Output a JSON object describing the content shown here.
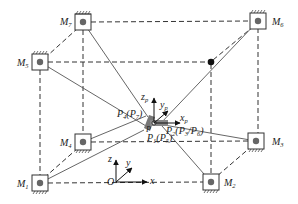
{
  "diagram": {
    "type": "cable-driven parallel robot schematic",
    "motors": [
      {
        "id": "M1",
        "label": "M",
        "sub": "1",
        "x": 40,
        "y": 183,
        "mount": "bottom"
      },
      {
        "id": "M2",
        "label": "M",
        "sub": "2",
        "x": 211,
        "y": 182,
        "mount": "bottom"
      },
      {
        "id": "M3",
        "label": "M",
        "sub": "3",
        "x": 256,
        "y": 141,
        "mount": "bottom"
      },
      {
        "id": "M4",
        "label": "M",
        "sub": "4",
        "x": 83,
        "y": 142,
        "mount": "bottom"
      },
      {
        "id": "M5",
        "label": "M",
        "sub": "5",
        "x": 40,
        "y": 62,
        "mount": "top"
      },
      {
        "id": "M6",
        "label": "M",
        "sub": "6",
        "x": 258,
        "y": 21,
        "mount": "top"
      },
      {
        "id": "M7",
        "label": "M",
        "sub": "7",
        "x": 83,
        "y": 22,
        "mount": "top"
      }
    ],
    "hidden_corner": {
      "x": 211,
      "y": 62
    },
    "platform": {
      "center": {
        "x": 152,
        "y": 125
      },
      "labels": {
        "p4": "P4(P7)",
        "p1": "P1(P5)",
        "p2": "P2(P3/P6)",
        "p": "P"
      },
      "frame_axes": {
        "z": "z",
        "z_sub": "p",
        "y": "y",
        "y_sub": "p",
        "x": "x",
        "x_sub": "p"
      }
    },
    "world_frame": {
      "origin_label": "O",
      "axes": {
        "x": "x",
        "y": "y",
        "z": "z"
      }
    }
  },
  "labels": {
    "M1": {
      "main": "M",
      "sub": "1"
    },
    "M2": {
      "main": "M",
      "sub": "2"
    },
    "M3": {
      "main": "M",
      "sub": "3"
    },
    "M4": {
      "main": "M",
      "sub": "4"
    },
    "M5": {
      "main": "M",
      "sub": "5"
    },
    "M6": {
      "main": "M",
      "sub": "6"
    },
    "M7": {
      "main": "M",
      "sub": "7"
    },
    "P4": {
      "main": "P",
      "sub": "4",
      "paren_main": "P",
      "paren_sub": "7"
    },
    "P1": {
      "main": "P",
      "sub": "1",
      "paren_main": "P",
      "paren_sub": "5"
    },
    "P2": {
      "main": "P",
      "sub": "2",
      "paren_a": "P",
      "paren_a_sub": "3",
      "paren_b": "P",
      "paren_b_sub": "6"
    },
    "P": "P",
    "O": "O",
    "x": "x",
    "y": "y",
    "z": "z",
    "xp": {
      "main": "x",
      "sub": "p"
    },
    "yp": {
      "main": "y",
      "sub": "p"
    },
    "zp": {
      "main": "z",
      "sub": "p"
    }
  }
}
